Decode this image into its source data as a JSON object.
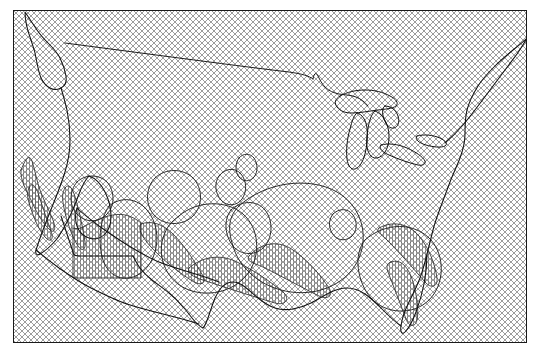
{
  "figure": {
    "background_color": "#ffffff",
    "width_px": 540,
    "height_px": 354,
    "title": "",
    "xlabel": "",
    "ylabel": ""
  },
  "axes": {
    "frame_color": "#1a1a1a",
    "frame_linewidth": 1.3,
    "left_px": 13,
    "top_px": 10,
    "width_px": 514,
    "height_px": 333,
    "xticks": [],
    "yticks": [],
    "xticklabels": [],
    "yticklabels": [],
    "grid": false
  },
  "background_fill": {
    "name": "crosshatch-hatch",
    "hatch_symbol": "xx",
    "line_color": "#888888",
    "face_color": "#ffffff",
    "spacing_px": 6,
    "linewidth": 0.7
  },
  "map": {
    "projection": "lambert-conformal-conic",
    "region": "contiguous united states",
    "coastline_color": "#111111",
    "coastline_width": 1.0,
    "border_color": "#111111",
    "border_width": 0.8,
    "lakes_drawn": true
  },
  "contours": {
    "line_color": "#222222",
    "line_width": 0.9,
    "hatch_color": "#555555",
    "hatch_symbol": "|||",
    "levels": [
      1,
      2,
      3
    ],
    "regions": [
      "pacific-northwest-coast",
      "california-sierra",
      "desert-southwest",
      "southern-rockies",
      "texas-gulf",
      "midwest-ring",
      "southeast-appalachia",
      "florida-peninsula"
    ]
  },
  "chart_data": {
    "type": "map",
    "title": "",
    "xlabel": "",
    "ylabel": "",
    "grid": false,
    "legend_position": "none",
    "series": [
      {
        "name": "background-hatch",
        "style": "crosshatch",
        "values": []
      },
      {
        "name": "coastlines",
        "style": "line",
        "values": []
      },
      {
        "name": "significance-contours",
        "style": "hatched-contour",
        "values": []
      }
    ]
  }
}
